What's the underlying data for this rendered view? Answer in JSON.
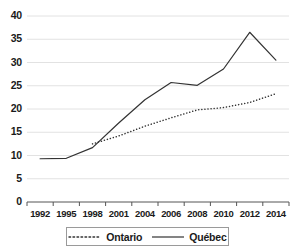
{
  "chart_data": {
    "type": "line",
    "title": "",
    "xlabel": "",
    "ylabel": "",
    "categories": [
      "1992",
      "1995",
      "1998",
      "2001",
      "2004",
      "2006",
      "2008",
      "2010",
      "2012",
      "2014"
    ],
    "ylim": [
      0,
      40
    ],
    "yticks": [
      0,
      5,
      10,
      15,
      20,
      25,
      30,
      35,
      40
    ],
    "ytick_labels": [
      "0",
      "5",
      "10",
      "15",
      "20",
      "25",
      "30",
      "35",
      "40"
    ],
    "grid": "horizontal",
    "legend_position": "bottom",
    "series": [
      {
        "name": "Ontario",
        "style": "dotted",
        "color": "#333333",
        "values": [
          null,
          null,
          12.5,
          14.2,
          16.3,
          18.1,
          19.8,
          20.3,
          21.4,
          23.3
        ]
      },
      {
        "name": "Québec",
        "style": "solid",
        "color": "#333333",
        "values": [
          9.3,
          9.4,
          11.7,
          17.0,
          22.0,
          25.7,
          25.1,
          28.6,
          36.5,
          30.5
        ]
      }
    ]
  },
  "legend": {
    "items": [
      {
        "label": "Ontario"
      },
      {
        "label": "Québec"
      }
    ]
  },
  "axes": {
    "y_axis_name": "value-axis",
    "x_axis_name": "year-axis"
  }
}
